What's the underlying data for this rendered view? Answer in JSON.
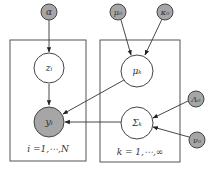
{
  "diagram": {
    "type": "plate-notation graphical model",
    "nodes": {
      "alpha": {
        "label": "α",
        "observed": true
      },
      "mu0": {
        "label": "μ₀",
        "observed": true
      },
      "kappa0": {
        "label": "κ₀",
        "observed": true
      },
      "z": {
        "label": "zᵢ",
        "observed": false
      },
      "y": {
        "label": "yᵢ",
        "observed": true
      },
      "mu_k": {
        "label": "μₖ",
        "observed": false
      },
      "sigma_k": {
        "label": "Σₖ",
        "observed": false
      },
      "lambda0": {
        "label": "Λ₀",
        "observed": true
      },
      "nu0": {
        "label": "ν₀",
        "observed": true
      }
    },
    "plates": {
      "left": {
        "label": "i =1,⋯,N"
      },
      "right": {
        "label": "k = 1,⋯,∞"
      }
    },
    "edges": [
      {
        "from": "alpha",
        "to": "z"
      },
      {
        "from": "z",
        "to": "y"
      },
      {
        "from": "mu0",
        "to": "mu_k"
      },
      {
        "from": "kappa0",
        "to": "mu_k"
      },
      {
        "from": "mu_k",
        "to": "y"
      },
      {
        "from": "sigma_k",
        "to": "y"
      },
      {
        "from": "lambda0",
        "to": "sigma_k"
      },
      {
        "from": "nu0",
        "to": "sigma_k"
      }
    ],
    "colors": {
      "observed_fill": "#a6a6a6",
      "latent_fill": "#ffffff",
      "stroke": "#444444"
    }
  }
}
